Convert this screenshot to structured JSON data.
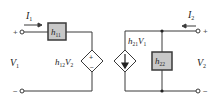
{
  "diagram": {
    "type": "h-parameter two-port equivalent circuit",
    "input_port": {
      "current_label": "I",
      "current_sub": "1",
      "voltage_label": "V",
      "voltage_sub": "1",
      "plus": "+",
      "minus": "−"
    },
    "output_port": {
      "current_label": "I",
      "current_sub": "2",
      "voltage_label": "V",
      "voltage_sub": "2",
      "plus": "+",
      "minus": "−"
    },
    "elements": {
      "h11": {
        "base": "h",
        "sub": "11"
      },
      "h12": {
        "base": "h",
        "sub": "12",
        "suffix": "V",
        "suffix_sub": "2"
      },
      "h21": {
        "base": "h",
        "sub": "21",
        "suffix": "V",
        "suffix_sub": "1"
      },
      "h22": {
        "base": "h",
        "sub": "22"
      },
      "vs_plus": "+",
      "vs_minus": "−"
    },
    "colors": {
      "wire": "#3a3a3a",
      "box_fill": "#c8c8c8",
      "box_stroke": "#3a3a3a"
    }
  }
}
